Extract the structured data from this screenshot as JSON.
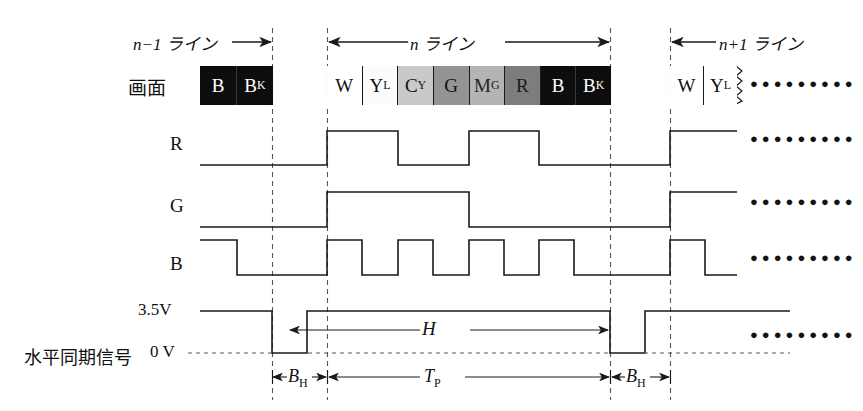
{
  "diagram": {
    "screen_row_label": "画面",
    "sync_row_label": "水平同期信号",
    "signal_rows": [
      "R",
      "G",
      "B"
    ],
    "voltage_high": "3.5V",
    "voltage_low": "0 V",
    "continuation_marker": "●●●●●●●●●",
    "span_labels": {
      "prev_line": "n−1 ライン",
      "current_line": "n ライン",
      "next_line": "n+1 ライン",
      "blanking_left": "B",
      "blanking_left_sub": "H",
      "blanking_right": "B",
      "blanking_right_sub": "H",
      "period_total": "H",
      "period_picture": "T",
      "period_picture_sub": "P"
    },
    "colorbars": {
      "prev_line_cells": [
        {
          "label": "B",
          "sub": "",
          "fill": "#0d0d0d",
          "text": "#ffffff"
        },
        {
          "label": "B",
          "sub": "K",
          "fill": "#0d0d0d",
          "text": "#ffffff"
        }
      ],
      "current_line_cells": [
        {
          "label": "W",
          "sub": "",
          "fill": "#ffffff",
          "text": "#111111"
        },
        {
          "label": "Y",
          "sub": "L",
          "fill": "#fbfbfb",
          "text": "#111111"
        },
        {
          "label": "C",
          "sub": "Y",
          "fill": "#c9c9c9",
          "text": "#111111"
        },
        {
          "label": "G",
          "sub": "",
          "fill": "#949494",
          "text": "#111111"
        },
        {
          "label": "M",
          "sub": "G",
          "fill": "#b4b4b4",
          "text": "#222222"
        },
        {
          "label": "R",
          "sub": "",
          "fill": "#7d7d7d",
          "text": "#1a1a1a"
        },
        {
          "label": "B",
          "sub": "",
          "fill": "#0d0d0d",
          "text": "#ffffff"
        },
        {
          "label": "B",
          "sub": "K",
          "fill": "#0d0d0d",
          "text": "#ffffff"
        }
      ],
      "next_line_cells": [
        {
          "label": "W",
          "sub": "",
          "fill": "#ffffff",
          "text": "#111111"
        },
        {
          "label": "Y",
          "sub": "L",
          "fill": "#ffffff",
          "text": "#111111"
        }
      ]
    },
    "waveforms": {
      "R": {
        "description": "high over W,YL then low over CY,G then high over MG,R then low over B,BK",
        "pattern": [
          1,
          1,
          0,
          0,
          1,
          1,
          0,
          0
        ]
      },
      "G": {
        "description": "high over W,YL,CY,G then low over MG,R,B,BK",
        "pattern": [
          1,
          1,
          1,
          1,
          0,
          0,
          0,
          0
        ]
      },
      "B": {
        "description": "alternating high/low each cell starting high at W",
        "pattern": [
          1,
          0,
          1,
          0,
          1,
          0,
          1,
          0
        ]
      }
    },
    "colors": {
      "line": "#1a1a1a",
      "dash": "#555555",
      "background": "#ffffff"
    }
  }
}
